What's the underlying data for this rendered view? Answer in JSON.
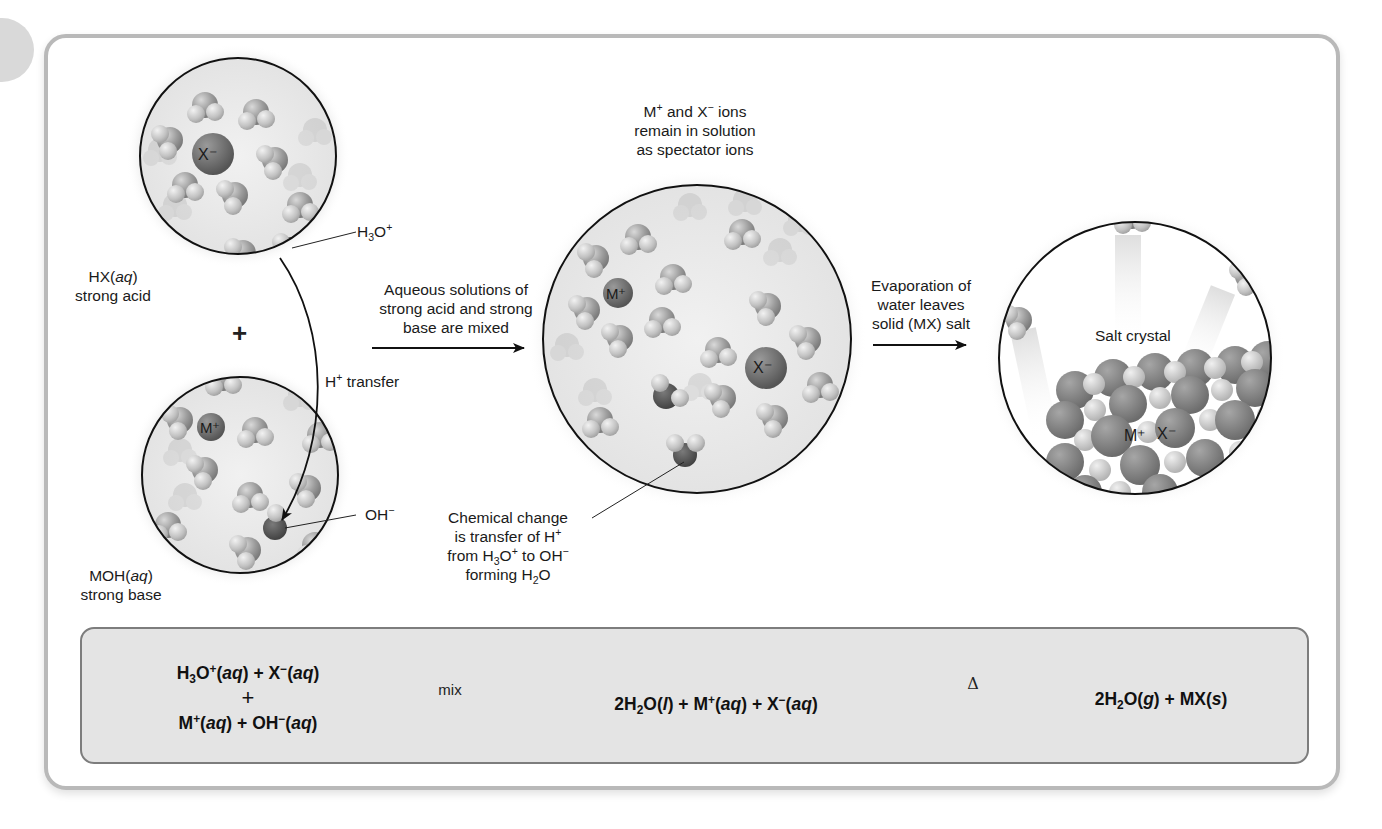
{
  "figure": {
    "left_panel": {
      "acid_circle": {
        "label_line1": "HX(",
        "label_italic": "aq",
        "label_line1_end": ")",
        "label_line2": "strong acid",
        "ion_label": "X⁻",
        "pointer_label_main": "H",
        "pointer_label_sub": "3",
        "pointer_label_rest": "O",
        "pointer_label_sup": "+"
      },
      "plus_sign": "+",
      "base_circle": {
        "label_line1": "MOH(",
        "label_italic": "aq",
        "label_line1_end": ")",
        "label_line2": "strong base",
        "ion_label": "M⁺",
        "pointer_label_main": "OH",
        "pointer_label_sup": "−"
      },
      "transfer_label_main": "H",
      "transfer_label_sup": "+",
      "transfer_label_rest": " transfer"
    },
    "mix_arrow": {
      "line1": "Aqueous solutions of",
      "line2": "strong acid and strong",
      "line3": "base are mixed"
    },
    "middle_panel": {
      "top_caption": {
        "l1_a": "M",
        "l1_a_sup": "+",
        "l1_b": " and X",
        "l1_b_sup": "−",
        "l1_c": " ions",
        "line2": "remain in solution",
        "line3": "as spectator ions"
      },
      "ion_m": "M⁺",
      "ion_x": "X⁻",
      "bottom_caption": {
        "line1": "Chemical change",
        "line2_a": "is transfer of H",
        "line2_sup": "+",
        "line3_a": "from H",
        "line3_sub": "3",
        "line3_b": "O",
        "line3_sup": "+",
        "line3_c": " to OH",
        "line3_sup2": "−",
        "line4_a": "forming H",
        "line4_sub": "2",
        "line4_b": "O"
      }
    },
    "evap_arrow": {
      "line1": "Evaporation of",
      "line2": "water leaves",
      "line3": "solid (MX) salt"
    },
    "right_panel": {
      "caption": "Salt crystal",
      "ion_m": "M⁺",
      "ion_x": "X⁻"
    },
    "equation_box": {
      "reactants_line1": {
        "a": "H",
        "sub": "3",
        "b": "O",
        "sup": "+",
        "c": "(",
        "i": "aq",
        "d": ") + X",
        "sup2": "−",
        "e": "(",
        "i2": "aq",
        "f": ")"
      },
      "reactants_plus": "+",
      "reactants_line2": {
        "a": "M",
        "sup": "+",
        "b": "(",
        "i": "aq",
        "c": ") + OH",
        "sup2": "−",
        "d": "(",
        "i2": "aq",
        "e": ")"
      },
      "arrow1_label": "mix",
      "intermediate": {
        "a": "2H",
        "sub": "2",
        "b": "O(",
        "i": "l",
        "c": ") + M",
        "sup": "+",
        "d": "(",
        "i2": "aq",
        "e": ") + X",
        "sup2": "−",
        "f": "(",
        "i3": "aq",
        "g": ")"
      },
      "arrow2_label": "Δ",
      "products": {
        "a": "2H",
        "sub": "2",
        "b": "O(",
        "i": "g",
        "c": ") + MX(",
        "i2": "s",
        "d": ")"
      }
    },
    "colors": {
      "frame": "#b9b9b9",
      "equation_fill": "#e4e4e4",
      "equation_border": "#7d7d7d",
      "circle_fill": "#e9e9e9",
      "water_molecule": "#9a9a9a",
      "ion_dark": "#6b6b6b"
    }
  }
}
